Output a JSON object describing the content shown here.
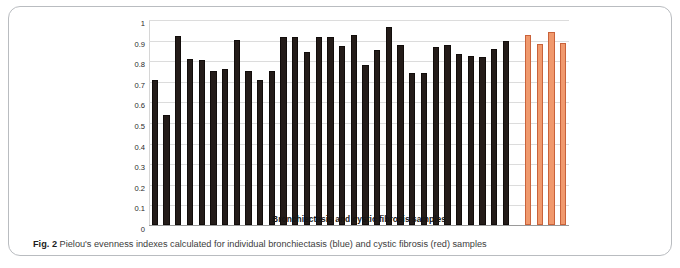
{
  "figure": {
    "label": "Fig. 2",
    "caption": "Pielou's evenness indexes calculated for individual bronchiectasis (blue) and cystic fibrosis (red) samples"
  },
  "chart_data": {
    "type": "bar",
    "title": "",
    "xlabel": "Bronchiectasis and cystic fibrosis samples",
    "ylabel": "Pielou's evenness index",
    "ylim": [
      0,
      1
    ],
    "ytick_labels": [
      "1",
      "0.9",
      "0.8",
      "0.7",
      "0.6",
      "0.5",
      "0.4",
      "0.3",
      "0.2",
      "0.1",
      "0"
    ],
    "ytick_values": [
      1,
      0.9,
      0.8,
      0.7,
      0.6,
      0.5,
      0.4,
      0.3,
      0.2,
      0.1,
      0
    ],
    "grid": true,
    "legend_position": "none",
    "xtick_labels": [],
    "colors": {
      "bronchiectasis": "#241c19",
      "cystic_fibrosis": "#f0996d",
      "cystic_fibrosis_border": "#c9623a",
      "gridline": "#dcdcdc"
    },
    "series": [
      {
        "name": "Bronchiectasis",
        "color": "#241c19",
        "values": [
          0.705,
          0.535,
          0.918,
          0.808,
          0.802,
          0.747,
          0.759,
          0.897,
          0.747,
          0.704,
          0.75,
          0.913,
          0.913,
          0.838,
          0.915,
          0.915,
          0.868,
          0.92,
          0.777,
          0.85,
          0.963,
          0.872,
          0.736,
          0.74,
          0.862,
          0.875,
          0.828,
          0.822,
          0.818,
          0.855,
          0.893
        ]
      },
      {
        "name": "Cystic fibrosis",
        "color": "#f0996d",
        "values": [
          0.92,
          0.88,
          0.938,
          0.884
        ]
      }
    ],
    "bar_count_bronchiectasis": 31,
    "bar_count_cystic_fibrosis": 4
  }
}
